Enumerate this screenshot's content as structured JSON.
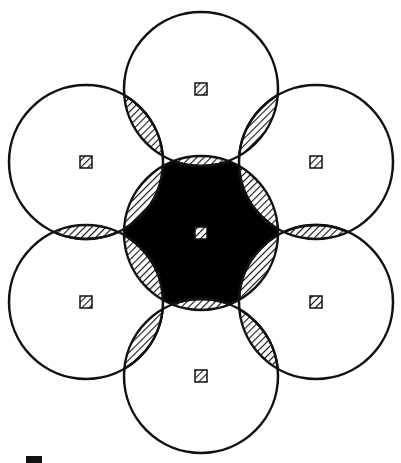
{
  "diagram": {
    "title": "",
    "width": 401,
    "height": 463,
    "radius": 77,
    "colors": {
      "stroke": "#111111",
      "fill_core": "#000000",
      "background": "#ffffff",
      "hatch": "#111111"
    },
    "center": {
      "id": "center",
      "cx": 201,
      "cy": 233
    },
    "outer": [
      {
        "id": "top",
        "cx": 201,
        "cy": 89
      },
      {
        "id": "upper-right",
        "cx": 316,
        "cy": 162
      },
      {
        "id": "lower-right",
        "cx": 316,
        "cy": 302
      },
      {
        "id": "bottom",
        "cx": 201,
        "cy": 376
      },
      {
        "id": "lower-left",
        "cx": 86,
        "cy": 302
      },
      {
        "id": "upper-left",
        "cx": 86,
        "cy": 162
      }
    ],
    "marker_size": 12,
    "legend_marker": {
      "x": 26,
      "y": 456,
      "w": 16,
      "h": 7
    }
  }
}
